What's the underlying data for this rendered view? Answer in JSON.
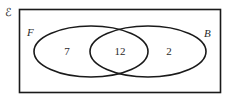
{
  "diagram": {
    "type": "venn",
    "universal_symbol": "ℰ",
    "sets": [
      {
        "name": "F",
        "label": "F"
      },
      {
        "name": "B",
        "label": "B"
      }
    ],
    "regions": {
      "F_only": "7",
      "F_and_B": "12",
      "B_only": "2"
    },
    "colors": {
      "stroke": "#1a1a1a",
      "text": "#2a2a2a",
      "background": "#ffffff"
    }
  }
}
